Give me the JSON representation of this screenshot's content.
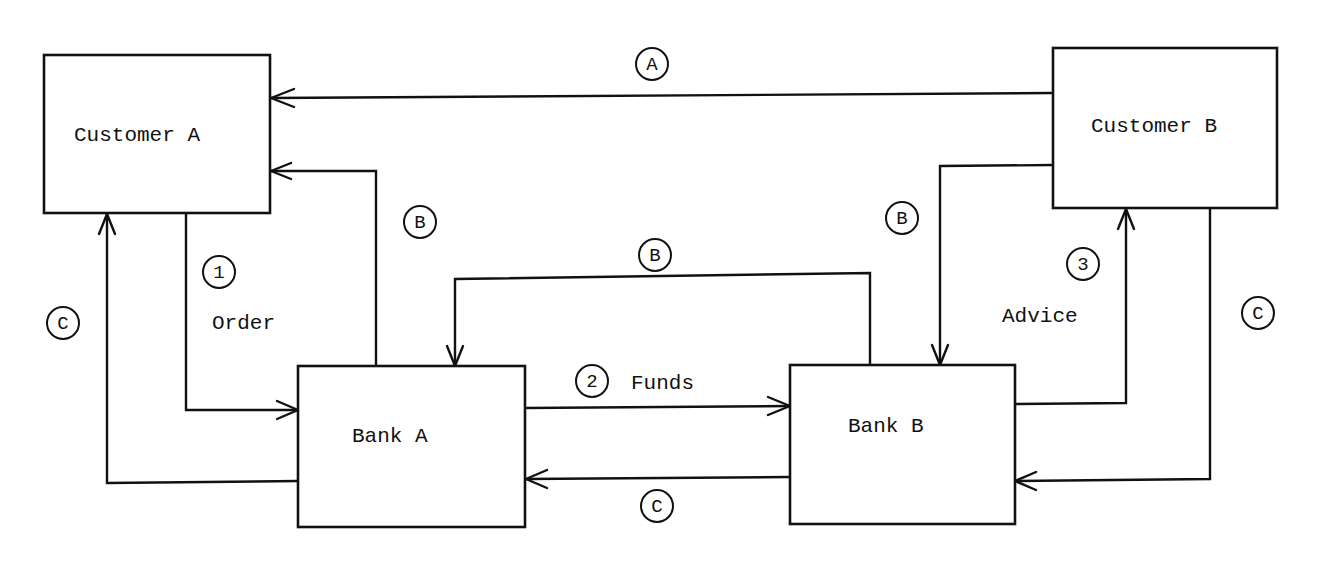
{
  "diagram": {
    "nodes": {
      "customer_a": {
        "label": "Customer A"
      },
      "customer_b": {
        "label": "Customer B"
      },
      "bank_a": {
        "label": "Bank A"
      },
      "bank_b": {
        "label": "Bank B"
      }
    },
    "badges": {
      "a_top": "A",
      "b_left": "B",
      "b_middle": "B",
      "b_right": "B",
      "c_left": "C",
      "c_bottom": "C",
      "c_right": "C",
      "step1": "1",
      "step2": "2",
      "step3": "3"
    },
    "edge_labels": {
      "order": "Order",
      "funds": "Funds",
      "advice": "Advice"
    },
    "edges": [
      {
        "from": "Customer B",
        "to": "Customer A",
        "badge": "A"
      },
      {
        "from": "Bank A",
        "to": "Customer A",
        "badge": "B"
      },
      {
        "from": "Bank B",
        "to": "Bank A",
        "badge": "B"
      },
      {
        "from": "Customer B",
        "to": "Bank B",
        "badge": "B"
      },
      {
        "from": "Customer A",
        "to": "Bank A",
        "badge": "1",
        "label": "Order"
      },
      {
        "from": "Bank A",
        "to": "Bank B",
        "badge": "2",
        "label": "Funds"
      },
      {
        "from": "Bank B",
        "to": "Customer B",
        "badge": "3",
        "label": "Advice"
      },
      {
        "from": "Bank A",
        "to": "Customer A",
        "badge": "C"
      },
      {
        "from": "Bank B",
        "to": "Bank A",
        "badge": "C"
      },
      {
        "from": "Customer B",
        "to": "Bank B",
        "badge": "C"
      }
    ]
  }
}
